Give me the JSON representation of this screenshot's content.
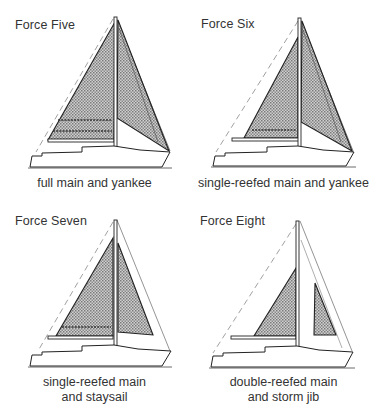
{
  "colors": {
    "ink": "#2a2a2a",
    "sail_fill": "#b8b8b8",
    "background": "#ffffff"
  },
  "panels": [
    {
      "id": "force-five",
      "title": "Force Five",
      "caption_lines": [
        "full main and yankee"
      ],
      "mainsail": "full",
      "headsail": "yankee",
      "reefs": 2
    },
    {
      "id": "force-six",
      "title": "Force Six",
      "caption_lines": [
        "single-reefed main and yankee"
      ],
      "mainsail": "single-reefed",
      "headsail": "yankee",
      "reefs": 1
    },
    {
      "id": "force-seven",
      "title": "Force Seven",
      "caption_lines": [
        "single-reefed main",
        "and staysail"
      ],
      "mainsail": "single-reefed",
      "headsail": "staysail",
      "reefs": 1
    },
    {
      "id": "force-eight",
      "title": "Force Eight",
      "caption_lines": [
        "double-reefed main",
        "and storm jib"
      ],
      "mainsail": "double-reefed",
      "headsail": "storm jib",
      "reefs": 0
    }
  ]
}
